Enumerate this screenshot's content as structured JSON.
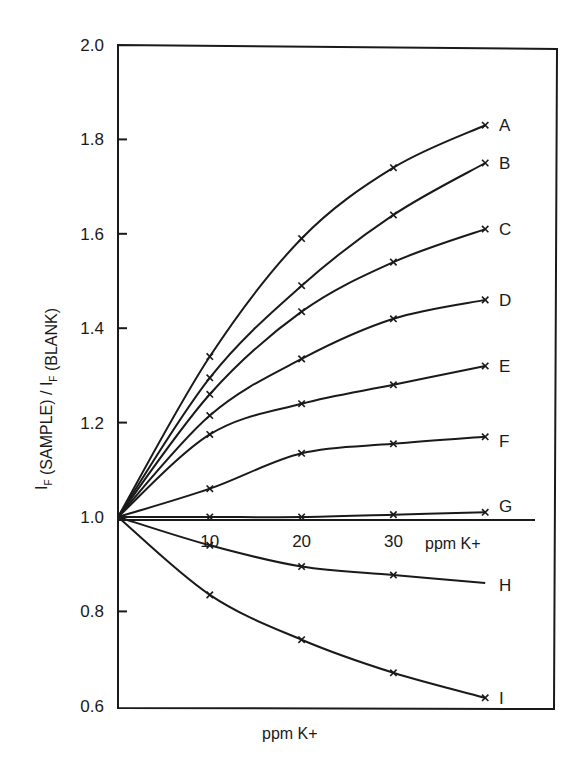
{
  "chart_data": {
    "type": "line",
    "title": "",
    "xlabel": "ppm K+",
    "ylabel": "I_F (SAMPLE) / I_F (BLANK)",
    "inner_xlabel": "ppm K+",
    "x_tick_labels": [
      "10",
      "20",
      "30"
    ],
    "y_tick_labels": [
      "2.0",
      "1.8",
      "1.6",
      "1.4",
      "1.2",
      "1.0",
      "0.8",
      "0.6"
    ],
    "ylim": [
      0.6,
      2.0
    ],
    "xlim": [
      0,
      40
    ],
    "grid": false,
    "legend": "inline labels at right end of each curve",
    "x": [
      0,
      10,
      20,
      30,
      40
    ],
    "series": [
      {
        "name": "A",
        "values": [
          1.0,
          1.34,
          1.59,
          1.74,
          1.83
        ],
        "curve_ends": 1.83
      },
      {
        "name": "B",
        "values": [
          1.0,
          1.295,
          1.49,
          1.64,
          1.75
        ],
        "curve_ends": 1.75
      },
      {
        "name": "C",
        "values": [
          1.0,
          1.26,
          1.435,
          1.54,
          1.61
        ],
        "curve_ends": 1.61
      },
      {
        "name": "D",
        "values": [
          1.0,
          1.215,
          1.335,
          1.42,
          1.46
        ],
        "curve_ends": 1.46
      },
      {
        "name": "E",
        "values": [
          1.0,
          1.175,
          1.24,
          1.28,
          1.32
        ],
        "curve_ends": 1.32
      },
      {
        "name": "F",
        "values": [
          1.0,
          1.06,
          1.135,
          1.155,
          1.17
        ],
        "curve_ends": 1.17
      },
      {
        "name": "G",
        "values": [
          1.0,
          1.0,
          1.0,
          1.005,
          1.01
        ],
        "curve_ends": 1.01
      },
      {
        "name": "H",
        "values": [
          1.0,
          0.94,
          0.895,
          0.877,
          null
        ],
        "curve_ends": 0.86
      },
      {
        "name": "I",
        "values": [
          1.0,
          0.835,
          0.74,
          0.67,
          0.617
        ],
        "curve_ends": 0.617
      }
    ]
  }
}
